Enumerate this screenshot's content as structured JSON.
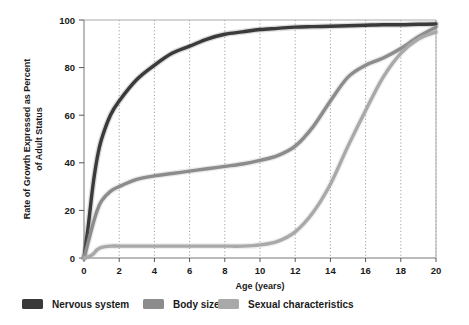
{
  "chart_data": {
    "type": "line",
    "title": "",
    "xlabel": "Age (years)",
    "ylabel": "Rate of Growth Expressed as Percent of Adult Status",
    "xlim": [
      0,
      20
    ],
    "ylim": [
      0,
      100
    ],
    "xticks": [
      "0",
      "2",
      "4",
      "6",
      "8",
      "10",
      "12",
      "14",
      "16",
      "18",
      "20"
    ],
    "yticks": [
      "0",
      "20",
      "40",
      "60",
      "80",
      "100"
    ],
    "grid": "vertical dotted gridlines at every x tick",
    "legend_position": "below plot, horizontal",
    "x": [
      0,
      0.25,
      0.5,
      0.75,
      1,
      1.5,
      2,
      3,
      4,
      5,
      6,
      7,
      8,
      9,
      10,
      11,
      12,
      13,
      14,
      15,
      16,
      17,
      18,
      19,
      20
    ],
    "series": [
      {
        "name": "Nervous system",
        "color": "#3a3a3a",
        "values": [
          0,
          14,
          30,
          42,
          50,
          60,
          66,
          75,
          81,
          86,
          89,
          92,
          94,
          95,
          96,
          96.5,
          97,
          97.2,
          97.4,
          97.6,
          97.8,
          98,
          98,
          98.2,
          98.3
        ]
      },
      {
        "name": "Body size",
        "color": "#8c8c8c",
        "values": [
          0,
          7,
          14,
          20,
          24,
          28,
          30,
          33,
          34.5,
          35.5,
          36.5,
          37.5,
          38.5,
          39.5,
          41,
          43,
          47,
          55,
          66,
          76,
          81,
          84,
          88,
          93,
          97
        ]
      },
      {
        "name": "Sexual characteristics",
        "color": "#a9a9a9",
        "values": [
          0,
          0.5,
          1.5,
          3.5,
          4.5,
          5,
          5,
          5,
          5,
          5,
          5,
          5,
          5,
          5,
          5.5,
          7,
          11,
          19,
          31,
          47,
          62,
          76,
          86,
          92,
          95
        ]
      }
    ]
  },
  "legend": {
    "items": [
      {
        "label": "Nervous system",
        "color": "#3a3a3a"
      },
      {
        "label": "Body size",
        "color": "#8c8c8c"
      },
      {
        "label": "Sexual characteristics",
        "color": "#a9a9a9"
      }
    ]
  },
  "axes": {
    "x_title": "Age (years)",
    "y_title_line1": "Rate of Growth Expressed as Percent",
    "y_title_line2": "of Adult Status"
  }
}
